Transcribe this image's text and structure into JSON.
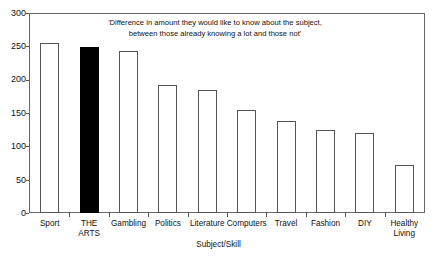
{
  "chart_data": {
    "type": "bar",
    "title": "'Difference in amount they would like to know about the subject, between those already knowing a lot and those not'",
    "title_line1": "'Difference in amount they would like to know about the subject,",
    "title_line2": "between those already knowing a lot and those not'",
    "xlabel": "Subject/Skill",
    "ylabel": "",
    "ylim": [
      0,
      300
    ],
    "ytick_labels": [
      "300",
      "250",
      "200",
      "150",
      "100",
      "50",
      "0"
    ],
    "yticks": [
      300,
      250,
      200,
      150,
      100,
      50,
      0
    ],
    "grid": false,
    "legend": "none",
    "categories": [
      "Sport",
      "THE\nARTS",
      "Gambling",
      "Politics",
      "Literature",
      "Computers",
      "Travel",
      "Fashion",
      "DIY",
      "Healthy\nLiving"
    ],
    "values": [
      256,
      250,
      244,
      193,
      186,
      155,
      138,
      125,
      120,
      73
    ],
    "highlight_index": 1,
    "bar_fill_default": "#ffffff",
    "bar_fill_highlight": "#000000",
    "bar_edge_color": "#555555",
    "axis_color": "#666666",
    "background": "#ffffff"
  }
}
